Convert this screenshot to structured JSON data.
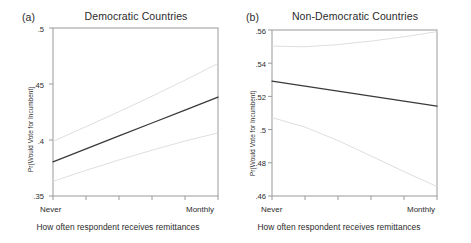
{
  "figure": {
    "background": "#ffffff",
    "line_color": "#3a3a3a",
    "ci_color": "#d8d8d8",
    "axis_color": "#9a9a9a",
    "shared_xlabel": "How often respondent receives remittances",
    "shared_ylabel": "Pr(Would Vote for Incumbent)"
  },
  "chart_data": [
    {
      "type": "line",
      "panel_tag": "(a)",
      "title": "Democratic Countries",
      "xlabel": "How often respondent receives remittances",
      "ylabel": "Pr(Would Vote for Incumbent)",
      "xlim": [
        0,
        5
      ],
      "ylim": [
        0.35,
        0.5
      ],
      "yticks": [
        0.35,
        0.4,
        0.45,
        0.5
      ],
      "ytick_labels": [
        ".35",
        ".4",
        ".45",
        ".5"
      ],
      "xticks": [
        0,
        1,
        2,
        3,
        4,
        5
      ],
      "xtick_labels": [
        "Never",
        "",
        "",
        "",
        "",
        "Monthly"
      ],
      "grid": false,
      "legend": "none",
      "x": [
        0,
        1,
        2,
        3,
        4,
        5
      ],
      "series": [
        {
          "name": "Predicted probability",
          "style": "solid",
          "color": "#3a3a3a",
          "values": [
            0.3805,
            0.3921,
            0.4036,
            0.4152,
            0.4267,
            0.4383
          ]
        },
        {
          "name": "95% CI upper",
          "style": "solid-light",
          "color": "#d8d8d8",
          "values": [
            0.3988,
            0.4119,
            0.4253,
            0.4391,
            0.4534,
            0.4683
          ]
        },
        {
          "name": "95% CI lower",
          "style": "solid-light",
          "color": "#d8d8d8",
          "values": [
            0.3631,
            0.3729,
            0.3822,
            0.3909,
            0.3991,
            0.4063
          ]
        }
      ]
    },
    {
      "type": "line",
      "panel_tag": "(b)",
      "title": "Non-Democratic Countries",
      "xlabel": "How often respondent receives remittances",
      "ylabel": "Pr(Would Vote for Incumbent)",
      "xlim": [
        0,
        5
      ],
      "ylim": [
        0.46,
        0.56
      ],
      "yticks": [
        0.46,
        0.48,
        0.5,
        0.52,
        0.54,
        0.56
      ],
      "ytick_labels": [
        ".46",
        ".48",
        ".5",
        ".52",
        ".54",
        ".56"
      ],
      "xticks": [
        0,
        1,
        2,
        3,
        4,
        5
      ],
      "xtick_labels": [
        "Never",
        "",
        "",
        "",
        "",
        "Monthly"
      ],
      "grid": false,
      "legend": "none",
      "x": [
        0,
        1,
        2,
        3,
        4,
        5
      ],
      "series": [
        {
          "name": "Predicted probability",
          "style": "solid",
          "color": "#3a3a3a",
          "values": [
            0.5292,
            0.5262,
            0.5232,
            0.5201,
            0.5171,
            0.5141
          ]
        },
        {
          "name": "95% CI upper",
          "style": "solid-light",
          "color": "#d8d8d8",
          "values": [
            0.5503,
            0.5499,
            0.5512,
            0.5533,
            0.5559,
            0.559
          ]
        },
        {
          "name": "95% CI lower",
          "style": "solid-light",
          "color": "#d8d8d8",
          "values": [
            0.5072,
            0.5015,
            0.4934,
            0.4841,
            0.4747,
            0.4657
          ]
        }
      ]
    }
  ]
}
